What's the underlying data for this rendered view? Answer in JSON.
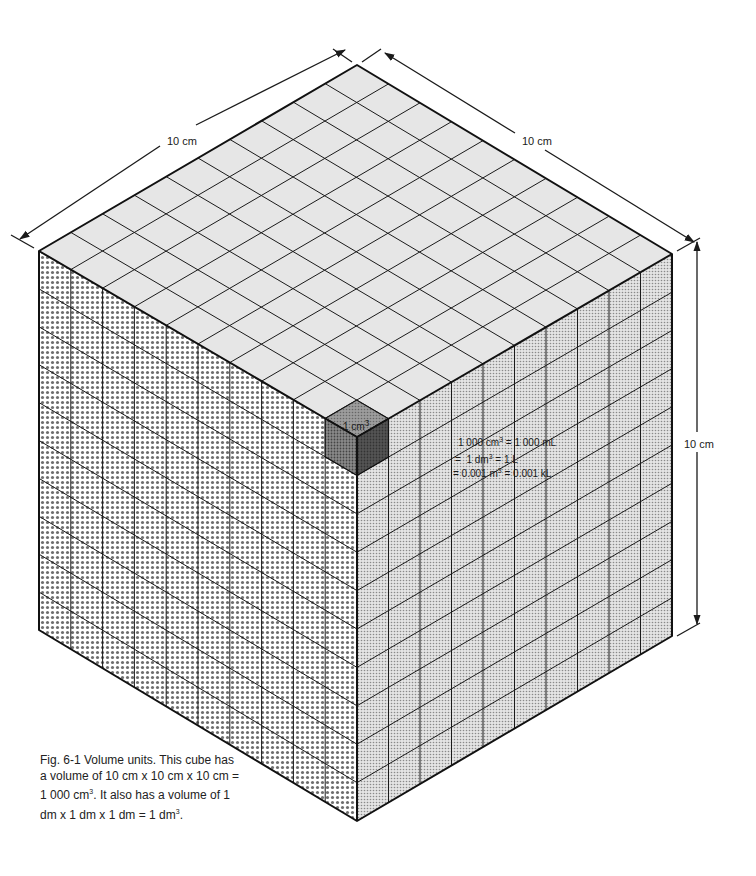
{
  "figure": {
    "type": "isometric-cube-volume-diagram",
    "grid_divisions": 10,
    "dimensions": {
      "top_left_edge": "10 cm",
      "top_right_edge": "10 cm",
      "vertical_edge": "10 cm"
    },
    "unit_cube_label": "1 cm",
    "unit_cube_label_sup": "3",
    "equivalences": {
      "line1_left": "1 000 cm",
      "line1_sup": "3",
      "line1_right": " = 1 000 mL",
      "line2_left": "=  1 dm",
      "line2_sup": "3",
      "line2_right": " = 1 L",
      "line3_left": "= 0.001 m",
      "line3_sup": "3",
      "line3_right": " = 0.001 kL"
    },
    "caption": {
      "part1": "Fig. 6-1  Volume units. This cube has a volume of 10 cm x 10 cm x 10 cm = 1 000 cm",
      "sup1": "3",
      "part2": ". It also has a volume of 1 dm x 1 dm x 1 dm = 1 dm",
      "sup2": "3",
      "part3": "."
    },
    "colors": {
      "top_face": "#e6e6e6",
      "left_face_dots": "#6e6e6e",
      "right_face_dots": "#9a9a9a",
      "unit_cube_dark": "#5a5a5a",
      "lines": "#1a1a1a"
    }
  }
}
